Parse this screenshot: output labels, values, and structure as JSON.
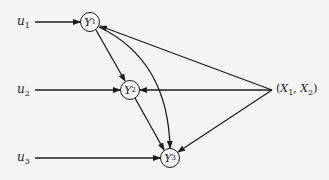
{
  "diagram": {
    "inputs": [
      {
        "id": "u1",
        "base": "u",
        "sub": "1"
      },
      {
        "id": "u2",
        "base": "u",
        "sub": "2"
      },
      {
        "id": "u3",
        "base": "u",
        "sub": "3"
      }
    ],
    "nodes": [
      {
        "id": "Y1",
        "base": "Y",
        "sub": "1"
      },
      {
        "id": "Y2",
        "base": "Y",
        "sub": "2"
      },
      {
        "id": "Y3",
        "base": "Y",
        "sub": "3"
      }
    ],
    "exogenous": {
      "open": "(",
      "x1_base": "X",
      "x1_sub": "1",
      "sep": ", ",
      "x2_base": "X",
      "x2_sub": "2",
      "close": ")"
    },
    "edges": [
      {
        "from": "u1",
        "to": "Y1"
      },
      {
        "from": "u2",
        "to": "Y2"
      },
      {
        "from": "u3",
        "to": "Y3"
      },
      {
        "from": "Y1",
        "to": "Y2"
      },
      {
        "from": "Y1",
        "to": "Y3",
        "curved": true
      },
      {
        "from": "Y2",
        "to": "Y3"
      },
      {
        "from": "(X1, X2)",
        "to": "Y1"
      },
      {
        "from": "(X1, X2)",
        "to": "Y2"
      },
      {
        "from": "(X1, X2)",
        "to": "Y3"
      }
    ],
    "colors": {
      "line": "#1e1e1e",
      "background": "#f4f4f2"
    }
  }
}
